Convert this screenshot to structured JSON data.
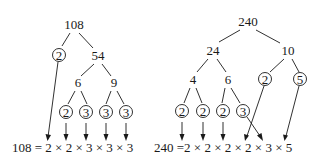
{
  "left_tree": {
    "root": "108",
    "level1": [
      "2",
      "54"
    ],
    "level2": [
      "6",
      "9"
    ],
    "leaves": [
      "2",
      "3",
      "3",
      "3"
    ],
    "equation": "108 = 2 × 2 × 3 × 3 × 3"
  },
  "right_tree": {
    "root": "240",
    "level1": [
      "24",
      "10"
    ],
    "level2": [
      "4",
      "6",
      "2",
      "5"
    ],
    "leaves": [
      "2",
      "2",
      "2",
      "3"
    ],
    "equation": "240 =2 × 2 × 2 × 2 × 3 × 5"
  },
  "colors": {
    "ink": "#1a1a1a",
    "background": "#ffffff"
  }
}
